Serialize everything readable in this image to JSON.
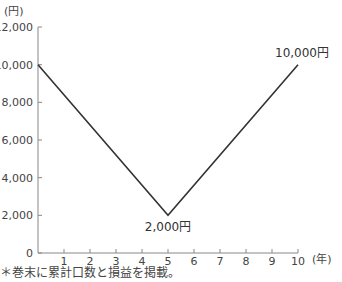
{
  "chart_data": {
    "type": "line",
    "title": "",
    "xlabel": "(年)",
    "ylabel": "(円)",
    "x": [
      0,
      5,
      10
    ],
    "series": [
      {
        "name": "price",
        "values": [
          10000,
          2000,
          10000
        ]
      }
    ],
    "xlim": [
      0,
      10
    ],
    "ylim": [
      0,
      12000
    ],
    "x_ticks": [
      "1",
      "2",
      "3",
      "4",
      "5",
      "6",
      "7",
      "8",
      "9",
      "10"
    ],
    "y_ticks": [
      "0",
      "2,000",
      "4,000",
      "6,000",
      "8,000",
      "10,000",
      "12,000"
    ],
    "annotations": [
      {
        "x": 5,
        "y": 2000,
        "text": "2,000円"
      },
      {
        "x": 10,
        "y": 10000,
        "text": "10,000円"
      }
    ],
    "grid": false,
    "line_color": "#333333"
  },
  "footnote": "＊巻末に累計口数と損益を掲載。"
}
